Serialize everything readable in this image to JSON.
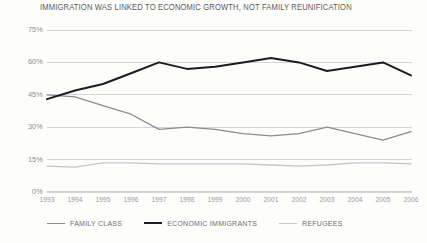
{
  "chart_data": {
    "type": "line",
    "title": "IMMIGRATION WAS LINKED TO ECONOMIC GROWTH, NOT FAMILY REUNIFICATION",
    "xlabel": "",
    "ylabel": "",
    "categories": [
      "1993",
      "1994",
      "1995",
      "1996",
      "1997",
      "1998",
      "1999",
      "2000",
      "2001",
      "2002",
      "2003",
      "2004",
      "2005",
      "2006"
    ],
    "ylim": [
      0,
      75
    ],
    "yticks": [
      0,
      15,
      30,
      45,
      60,
      75
    ],
    "ytick_labels": [
      "0%",
      "15%",
      "30%",
      "45%",
      "60%",
      "75%"
    ],
    "grid": true,
    "legend_position": "bottom",
    "series": [
      {
        "name": "FAMILY CLASS",
        "color": "#8c8c8c",
        "width": 1.3,
        "values": [
          45,
          44,
          40,
          36,
          29,
          30,
          29,
          27,
          26,
          27,
          30,
          27,
          24,
          28
        ]
      },
      {
        "name": "ECONOMIC IMMIGRANTS",
        "color": "#1c1c1c",
        "width": 2.0,
        "values": [
          43,
          47,
          50,
          55,
          60,
          57,
          58,
          60,
          62,
          60,
          56,
          58,
          60,
          54
        ]
      },
      {
        "name": "REFUGEES",
        "color": "#c6c6c6",
        "width": 1.3,
        "values": [
          12,
          11.5,
          13.5,
          13.5,
          13,
          13,
          13,
          13,
          12.5,
          12,
          12.5,
          13.5,
          13.5,
          13
        ]
      }
    ]
  }
}
